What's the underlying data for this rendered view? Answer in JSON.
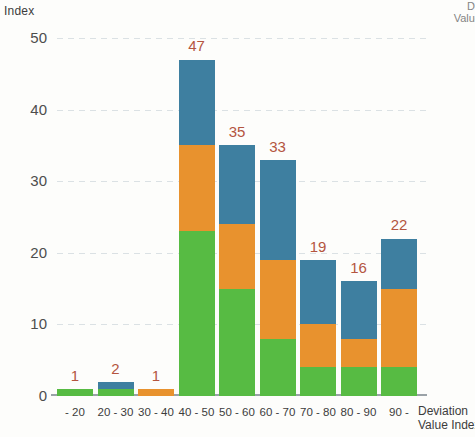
{
  "axis": {
    "y_title": "Index",
    "x_title_line1": "Deviation",
    "x_title_line2": "Value Index",
    "corner_line1": "De",
    "corner_line2": "Value"
  },
  "colors": {
    "green": "#57bb43",
    "orange": "#e8922e",
    "blue": "#3e7fa0",
    "label": "#b4553f",
    "axis_text": "#3a3a3a",
    "gridline": "#d8dee2",
    "baseline": "#9aa2a7",
    "background": "#fdfdfb"
  },
  "chart_data": {
    "type": "bar",
    "title": "",
    "subtitle": "",
    "xlabel": "Deviation Value Index",
    "ylabel": "Index",
    "ylim": [
      0,
      50
    ],
    "yticks": [
      50,
      40,
      30,
      20,
      10,
      0
    ],
    "grid": true,
    "stacked": true,
    "legend": "none",
    "categories": [
      "- 20",
      "20 - 30",
      "30 - 40",
      "40 - 50",
      "50 - 60",
      "60 - 70",
      "70 - 80",
      "80 - 90",
      "90 -"
    ],
    "series": [
      {
        "name": "green",
        "color": "#57bb43",
        "values": [
          1,
          1,
          0,
          23,
          15,
          8,
          4,
          4,
          4
        ]
      },
      {
        "name": "orange",
        "color": "#e8922e",
        "values": [
          0,
          0,
          1,
          12,
          9,
          11,
          6,
          4,
          11
        ]
      },
      {
        "name": "blue",
        "color": "#3e7fa0",
        "values": [
          0,
          1,
          0,
          12,
          11,
          14,
          9,
          8,
          7
        ]
      }
    ],
    "totals": [
      1,
      2,
      1,
      47,
      35,
      33,
      19,
      16,
      22
    ],
    "total_labels": [
      "1",
      "2",
      "1",
      "47",
      "35",
      "33",
      "19",
      "16",
      "22"
    ]
  }
}
